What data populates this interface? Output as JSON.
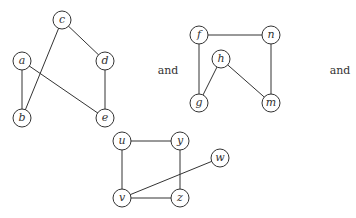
{
  "graphs": [
    {
      "name": "graph-1",
      "nodes": [
        {
          "id": "a",
          "label": "a",
          "x": 22,
          "y": 61
        },
        {
          "id": "b",
          "label": "b",
          "x": 22,
          "y": 118
        },
        {
          "id": "c",
          "label": "c",
          "x": 62,
          "y": 20
        },
        {
          "id": "d",
          "label": "d",
          "x": 105,
          "y": 61
        },
        {
          "id": "e",
          "label": "e",
          "x": 105,
          "y": 118
        }
      ],
      "edges": [
        [
          "a",
          "b"
        ],
        [
          "a",
          "e"
        ],
        [
          "c",
          "b"
        ],
        [
          "c",
          "d"
        ],
        [
          "d",
          "e"
        ]
      ]
    },
    {
      "name": "graph-2",
      "nodes": [
        {
          "id": "f",
          "label": "f",
          "x": 199,
          "y": 35
        },
        {
          "id": "n",
          "label": "n",
          "x": 271,
          "y": 35
        },
        {
          "id": "h",
          "label": "h",
          "x": 221,
          "y": 59
        },
        {
          "id": "g",
          "label": "g",
          "x": 199,
          "y": 103
        },
        {
          "id": "m",
          "label": "m",
          "x": 271,
          "y": 103
        }
      ],
      "edges": [
        [
          "f",
          "n"
        ],
        [
          "f",
          "g"
        ],
        [
          "h",
          "g"
        ],
        [
          "h",
          "m"
        ],
        [
          "n",
          "m"
        ]
      ]
    },
    {
      "name": "graph-3",
      "nodes": [
        {
          "id": "u",
          "label": "u",
          "x": 122,
          "y": 141
        },
        {
          "id": "y",
          "label": "y",
          "x": 180,
          "y": 141
        },
        {
          "id": "w",
          "label": "w",
          "x": 220,
          "y": 158
        },
        {
          "id": "v",
          "label": "v",
          "x": 122,
          "y": 198
        },
        {
          "id": "z",
          "label": "z",
          "x": 180,
          "y": 198
        }
      ],
      "edges": [
        [
          "u",
          "y"
        ],
        [
          "u",
          "v"
        ],
        [
          "y",
          "z"
        ],
        [
          "v",
          "z"
        ],
        [
          "v",
          "w"
        ]
      ]
    }
  ],
  "conjunctions": [
    {
      "text": "and",
      "x": 168,
      "y": 70
    },
    {
      "text": "and",
      "x": 340,
      "y": 70
    }
  ],
  "style": {
    "node_radius": 9,
    "stroke": "#333333"
  }
}
